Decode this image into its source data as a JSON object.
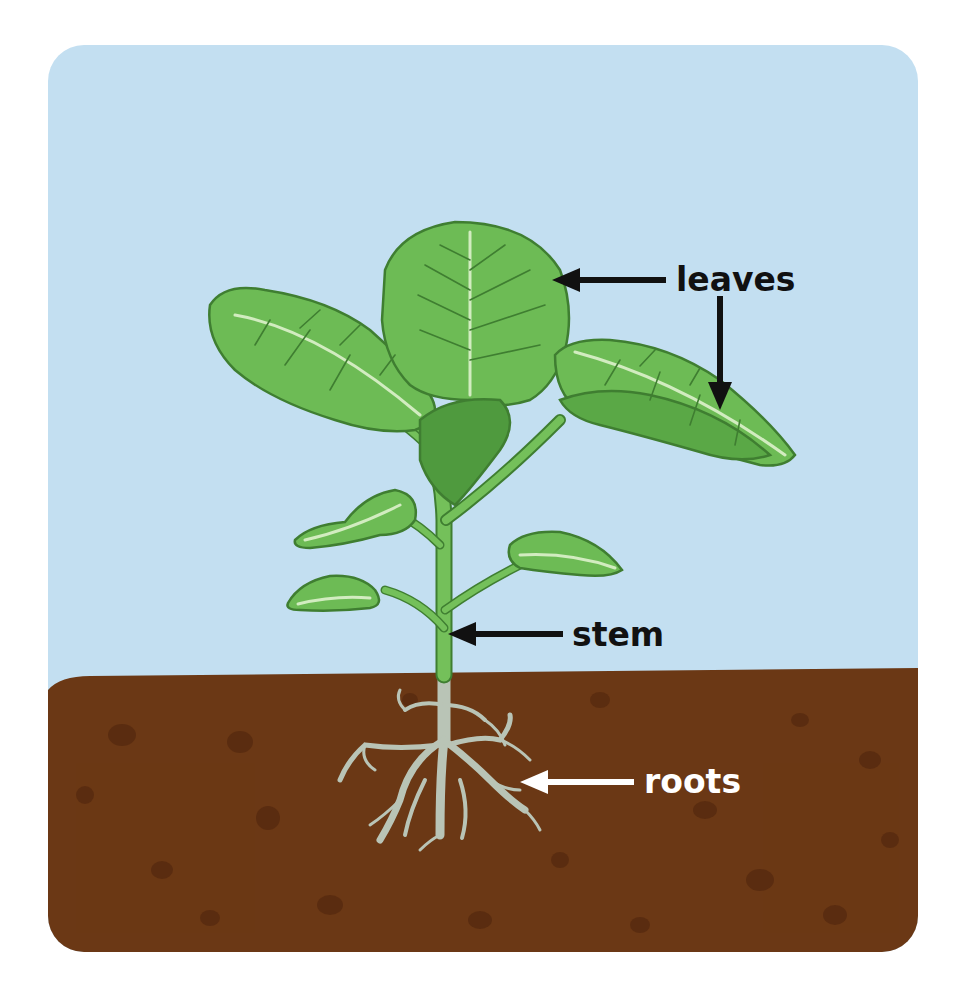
{
  "diagram": {
    "labels": {
      "leaves": "leaves",
      "stem": "stem",
      "roots": "roots"
    }
  },
  "colors": {
    "sky": "#c3dff1",
    "soil": "#6b3815",
    "soil_spot": "#55290f",
    "leaf": "#6dbb55",
    "leaf_dark": "#4f9a3e",
    "leaf_outline": "#3f7e31",
    "vein_light": "#d2ecc0",
    "stem": "#74c05a",
    "root": "#b9c4b6",
    "label_dark": "#111111",
    "label_light": "#ffffff"
  }
}
